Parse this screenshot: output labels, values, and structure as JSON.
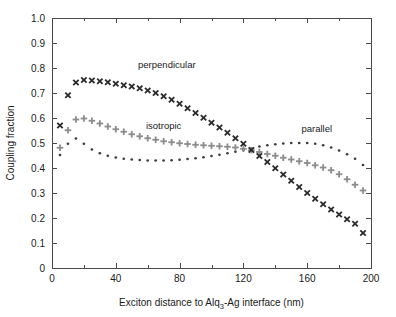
{
  "chart_data": {
    "type": "scatter",
    "title": "",
    "xlabel": "Exciton distance to Alq3-Ag interface (nm)",
    "xlabel_prefix": "Exciton distance to Alq",
    "xlabel_subscript": "3",
    "xlabel_suffix": "-Ag interface (nm)",
    "ylabel": "Coupling fraction",
    "xlim": [
      0,
      200
    ],
    "ylim": [
      0,
      1.0
    ],
    "xticks": [
      0,
      40,
      80,
      120,
      160,
      200
    ],
    "xtick_labels": [
      "0",
      "40",
      "80",
      "120",
      "160",
      "200"
    ],
    "xminor_step": 20,
    "yticks": [
      0,
      0.1,
      0.2,
      0.3,
      0.4,
      0.5,
      0.6,
      0.7,
      0.8,
      0.9,
      1.0
    ],
    "ytick_labels": [
      "0",
      "0.1",
      "0.2",
      "0.3",
      "0.4",
      "0.5",
      "0.6",
      "0.7",
      "0.8",
      "0.9",
      "1.0"
    ],
    "grid": false,
    "legend_position": "inline-annotations",
    "series": [
      {
        "name": "perpendicular",
        "marker": "x-bold",
        "color": "#2b2b2b",
        "label_x": 72,
        "label_y": 0.8,
        "x": [
          5,
          10,
          15,
          20,
          25,
          30,
          35,
          40,
          45,
          50,
          55,
          60,
          65,
          70,
          75,
          80,
          85,
          90,
          95,
          100,
          105,
          110,
          115,
          120,
          125,
          130,
          135,
          140,
          145,
          150,
          155,
          160,
          165,
          170,
          175,
          180,
          185,
          190,
          195
        ],
        "y": [
          0.57,
          0.691,
          0.742,
          0.752,
          0.75,
          0.747,
          0.743,
          0.737,
          0.731,
          0.726,
          0.719,
          0.71,
          0.7,
          0.687,
          0.673,
          0.657,
          0.639,
          0.62,
          0.601,
          0.581,
          0.562,
          0.541,
          0.519,
          0.497,
          0.472,
          0.448,
          0.424,
          0.399,
          0.374,
          0.349,
          0.324,
          0.3,
          0.277,
          0.255,
          0.234,
          0.214,
          0.195,
          0.177,
          0.14
        ]
      },
      {
        "name": "isotropic",
        "marker": "plus-bold",
        "color": "#8c8c8c",
        "label_x": 70,
        "label_y": 0.555,
        "x": [
          5,
          10,
          15,
          20,
          25,
          30,
          35,
          40,
          45,
          50,
          55,
          60,
          65,
          70,
          75,
          80,
          85,
          90,
          95,
          100,
          105,
          110,
          115,
          120,
          125,
          130,
          135,
          140,
          145,
          150,
          155,
          160,
          165,
          170,
          175,
          180,
          185,
          190,
          195
        ],
        "y": [
          0.481,
          0.551,
          0.594,
          0.598,
          0.589,
          0.578,
          0.566,
          0.555,
          0.545,
          0.535,
          0.527,
          0.519,
          0.513,
          0.507,
          0.503,
          0.499,
          0.496,
          0.493,
          0.491,
          0.489,
          0.487,
          0.485,
          0.482,
          0.477,
          0.471,
          0.464,
          0.456,
          0.449,
          0.441,
          0.434,
          0.427,
          0.42,
          0.411,
          0.402,
          0.391,
          0.375,
          0.355,
          0.333,
          0.31
        ]
      },
      {
        "name": "parallel",
        "marker": "dot",
        "color": "#3c3c3c",
        "label_x": 166,
        "label_y": 0.545,
        "x": [
          5,
          10,
          15,
          20,
          25,
          30,
          35,
          40,
          45,
          50,
          55,
          60,
          65,
          70,
          75,
          80,
          85,
          90,
          95,
          100,
          105,
          110,
          115,
          120,
          125,
          130,
          135,
          140,
          145,
          150,
          155,
          160,
          165,
          170,
          175,
          180,
          185,
          190,
          195
        ],
        "y": [
          0.452,
          0.497,
          0.518,
          0.497,
          0.474,
          0.459,
          0.449,
          0.442,
          0.437,
          0.434,
          0.432,
          0.43,
          0.43,
          0.43,
          0.431,
          0.433,
          0.436,
          0.439,
          0.443,
          0.448,
          0.453,
          0.459,
          0.465,
          0.472,
          0.479,
          0.486,
          0.491,
          0.495,
          0.498,
          0.5,
          0.5,
          0.5,
          0.497,
          0.491,
          0.482,
          0.47,
          0.455,
          0.437,
          0.412
        ]
      }
    ]
  },
  "geometry": {
    "plot_left": 52,
    "plot_right": 371,
    "plot_top": 18,
    "plot_bottom": 268
  }
}
